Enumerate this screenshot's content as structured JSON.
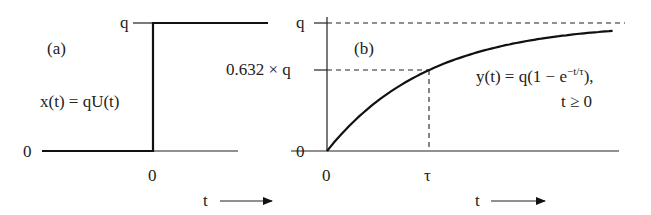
{
  "colors": {
    "ink": "#222222",
    "background": "#ffffff"
  },
  "panel_a": {
    "tag": "(a)",
    "equation": "x(t) = qU(t)",
    "y_tick_top": "q",
    "y_tick_zero": "0",
    "x_tick_zero": "0",
    "x_axis_label": "t",
    "arrow_icon": "right-arrow"
  },
  "panel_b": {
    "tag": "(b)",
    "equation_main": "y(t) = q(1 − e",
    "equation_exp": "−t/τ",
    "equation_tail": "),",
    "equation_condition": "t ≥ 0",
    "y_tick_top": "q",
    "y_tick_mid": "0.632 × q",
    "y_tick_zero": "0",
    "x_tick_zero": "0",
    "x_tick_tau": "τ",
    "x_axis_label": "t",
    "arrow_icon": "right-arrow"
  },
  "chart_data": [
    {
      "type": "line",
      "title": "(a) step input",
      "xlabel": "t",
      "ylabel": "",
      "series": [
        {
          "name": "x(t) = qU(t)",
          "x": [
            -1,
            0,
            0,
            1
          ],
          "y": [
            0,
            0,
            1,
            1
          ]
        }
      ],
      "y_ticks": [
        "0",
        "q"
      ],
      "x_ticks": [
        "0"
      ],
      "y_units": "q",
      "grid": false
    },
    {
      "type": "line",
      "title": "(b) first-order response",
      "xlabel": "t",
      "ylabel": "",
      "series": [
        {
          "name": "y(t) = q(1 - e^(-t/tau)), t >= 0",
          "function": "1 - exp(-t/tau)",
          "x_range_tau": [
            0,
            2.8
          ]
        }
      ],
      "reference_lines": [
        {
          "axis": "y",
          "value": 1,
          "label": "q",
          "style": "dashed"
        },
        {
          "axis": "y",
          "value": 0.632,
          "label": "0.632 x q",
          "style": "dashed"
        },
        {
          "axis": "x",
          "value": 1,
          "label": "tau",
          "style": "dashed"
        }
      ],
      "y_ticks": [
        "0",
        "0.632 x q",
        "q"
      ],
      "x_ticks": [
        "0",
        "tau"
      ],
      "y_units": "q",
      "x_units": "tau",
      "grid": false
    }
  ]
}
